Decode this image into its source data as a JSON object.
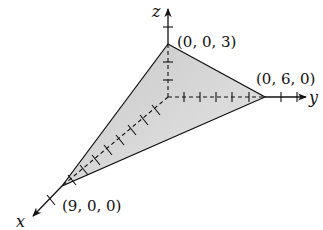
{
  "diagram": {
    "type": "3d-coordinate-plane-intercepts",
    "axes": {
      "x_label": "x",
      "y_label": "y",
      "z_label": "z"
    },
    "intercepts": {
      "x": {
        "label": "(9, 0, 0)",
        "value": [
          9,
          0,
          0
        ]
      },
      "y": {
        "label": "(0, 6, 0)",
        "value": [
          0,
          6,
          0
        ]
      },
      "z": {
        "label": "(0, 0, 3)",
        "value": [
          0,
          0,
          3
        ]
      }
    },
    "colors": {
      "plane_fill": "#d9d9d9",
      "line": "#111111",
      "background": "#ffffff"
    }
  }
}
